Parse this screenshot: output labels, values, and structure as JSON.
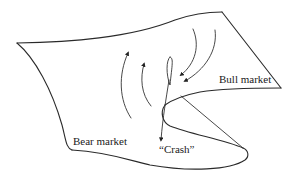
{
  "diagram": {
    "type": "cusp-catastrophe-surface",
    "labels": {
      "bull_market": "Bull market",
      "bear_market": "Bear market",
      "crash": "“Crash”"
    },
    "arrows": [
      {
        "id": "up-left",
        "direction": "up"
      },
      {
        "id": "up-right",
        "direction": "up"
      },
      {
        "id": "down-left",
        "direction": "down"
      },
      {
        "id": "down-right",
        "direction": "down"
      },
      {
        "id": "crash-drop",
        "direction": "down"
      }
    ],
    "colors": {
      "line": "#2a2a2a",
      "background": "#ffffff",
      "text": "#1a1a1a"
    }
  }
}
